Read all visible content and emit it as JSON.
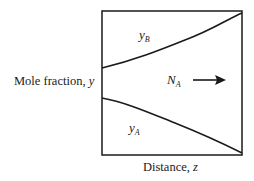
{
  "diagram": {
    "type": "binary-diffusion-profile",
    "axes": {
      "y_label": {
        "text": "Mole fraction, ",
        "var": "y"
      },
      "x_label": {
        "text": "Distance, ",
        "var": "z"
      }
    },
    "curves": [
      {
        "name": "y_B",
        "symbol": "y",
        "subscript": "B",
        "trend": "increasing with z"
      },
      {
        "name": "y_A",
        "symbol": "y",
        "subscript": "A",
        "trend": "decreasing with z"
      }
    ],
    "flux": {
      "symbol": "N",
      "subscript": "A",
      "direction": "right",
      "arrow": "→"
    },
    "colors": {
      "line": "#1a1a1a",
      "background": "#ffffff"
    }
  }
}
